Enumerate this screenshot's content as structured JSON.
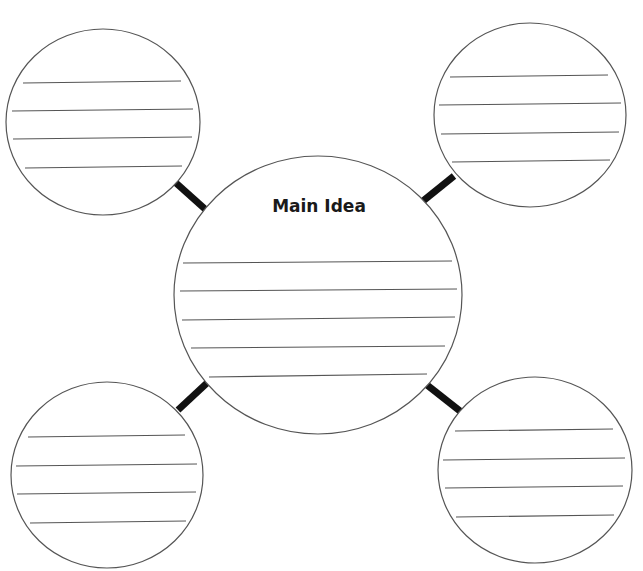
{
  "diagram": {
    "type": "concept-web",
    "header_text_clipped": "",
    "colors": {
      "background": "#ffffff",
      "circle_stroke": "#555555",
      "line_stroke": "#555555",
      "connector": "#111111",
      "label": "#1a1a1a"
    },
    "main_idea": {
      "label": "Main Idea",
      "cx": 318,
      "cy": 295,
      "rx": 144,
      "ry": 139,
      "writing_lines": [
        {
          "x1": 183,
          "y1": 263,
          "x2": 452,
          "y2": 261
        },
        {
          "x1": 180,
          "y1": 291,
          "x2": 457,
          "y2": 289
        },
        {
          "x1": 182,
          "y1": 320,
          "x2": 455,
          "y2": 317
        },
        {
          "x1": 191,
          "y1": 348,
          "x2": 445,
          "y2": 346
        },
        {
          "x1": 209,
          "y1": 377,
          "x2": 427,
          "y2": 374
        }
      ]
    },
    "details": [
      {
        "position": "top-left",
        "cx": 103,
        "cy": 122,
        "rx": 97,
        "ry": 93,
        "writing_lines": [
          {
            "x1": 23,
            "y1": 83,
            "x2": 181,
            "y2": 81
          },
          {
            "x1": 12,
            "y1": 111,
            "x2": 193,
            "y2": 109
          },
          {
            "x1": 13,
            "y1": 139,
            "x2": 192,
            "y2": 137
          },
          {
            "x1": 25,
            "y1": 168,
            "x2": 182,
            "y2": 166
          }
        ],
        "connector": {
          "x1": 176,
          "y1": 183,
          "x2": 205,
          "y2": 209
        }
      },
      {
        "position": "top-right",
        "cx": 530,
        "cy": 115,
        "rx": 96,
        "ry": 92,
        "writing_lines": [
          {
            "x1": 450,
            "y1": 77,
            "x2": 608,
            "y2": 75
          },
          {
            "x1": 439,
            "y1": 105,
            "x2": 621,
            "y2": 103
          },
          {
            "x1": 441,
            "y1": 134,
            "x2": 619,
            "y2": 132
          },
          {
            "x1": 452,
            "y1": 162,
            "x2": 610,
            "y2": 160
          }
        ],
        "connector": {
          "x1": 454,
          "y1": 176,
          "x2": 423,
          "y2": 201
        }
      },
      {
        "position": "bottom-left",
        "cx": 107,
        "cy": 475,
        "rx": 96,
        "ry": 93,
        "writing_lines": [
          {
            "x1": 28,
            "y1": 437,
            "x2": 185,
            "y2": 435
          },
          {
            "x1": 16,
            "y1": 466,
            "x2": 197,
            "y2": 464
          },
          {
            "x1": 17,
            "y1": 494,
            "x2": 196,
            "y2": 492
          },
          {
            "x1": 30,
            "y1": 523,
            "x2": 186,
            "y2": 521
          }
        ],
        "connector": {
          "x1": 178,
          "y1": 410,
          "x2": 207,
          "y2": 383
        }
      },
      {
        "position": "bottom-right",
        "cx": 535,
        "cy": 470,
        "rx": 97,
        "ry": 93,
        "writing_lines": [
          {
            "x1": 455,
            "y1": 431,
            "x2": 613,
            "y2": 429
          },
          {
            "x1": 443,
            "y1": 460,
            "x2": 625,
            "y2": 458
          },
          {
            "x1": 445,
            "y1": 488,
            "x2": 623,
            "y2": 486
          },
          {
            "x1": 456,
            "y1": 517,
            "x2": 614,
            "y2": 515
          }
        ],
        "connector": {
          "x1": 427,
          "y1": 385,
          "x2": 460,
          "y2": 411
        }
      }
    ]
  }
}
